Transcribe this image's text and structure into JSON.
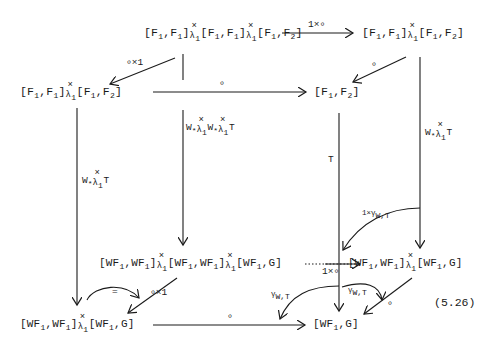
{
  "equation_number": "(5.26)",
  "nodes": {
    "top_back_left": "[F1,F1] ×λ1 [F1,F1] ×λ1 [F1,F2]",
    "top_back_right": "[F1,F1] ×λ1 [F1,F2]",
    "top_front_left": "[F1,F1] ×λ1 [F1,F2]",
    "top_front_right": "[F1,F2]",
    "bottom_back_left": "[WF1,WF1] ×λ1 [WF1,WF1] ×λ1 [WF1,G]",
    "bottom_back_right": "[WF1,WF1] ×λ1 [WF1,G]",
    "bottom_front_left": "[WF1,WF1] ×λ1 [WF1,G]",
    "bottom_front_right": "[WF1,G]"
  },
  "arrows": {
    "top_back_horizontal": "1×∘",
    "top_back_left_diag": "∘×1",
    "top_back_right_diag": "∘",
    "top_front_horizontal": "∘",
    "vert_front_left": "W* ×λ1 T",
    "vert_back_left": "W* ×λ1 W* ×λ1 T",
    "vert_front_right": "T",
    "vert_back_right": "W* ×λ1 T",
    "bottom_back_horizontal": "1×∘",
    "bottom_back_left_diag": "∘×1",
    "bottom_back_right_diag": "∘",
    "bottom_front_horizontal": "∘",
    "curve_left_equals": "=",
    "curve_right_upper": "1×γW,T",
    "curve_bottom_left": "γW,T",
    "curve_bottom_right": "γW,T"
  },
  "symbols": {
    "times": "×",
    "lambda_sub": "λ",
    "one": "1",
    "W_star": "W*",
    "T": "T",
    "compose": "∘",
    "equals": "=",
    "gamma": "γ",
    "W_T_sub": "W,T",
    "one_times_gamma": "1×γ"
  }
}
